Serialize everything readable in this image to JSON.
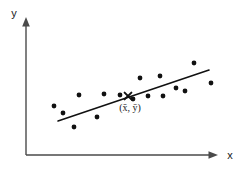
{
  "chart_data": {
    "type": "scatter",
    "title": "",
    "xlabel": "x",
    "ylabel": "y",
    "grid": false,
    "legend": false,
    "axis_style": "arrow-axes-unscaled",
    "xlim": [
      0,
      100
    ],
    "ylim": [
      0,
      100
    ],
    "points": [
      {
        "px": 54,
        "py": 106
      },
      {
        "px": 79,
        "py": 95
      },
      {
        "px": 74,
        "py": 127
      },
      {
        "px": 97,
        "py": 117
      },
      {
        "px": 104,
        "py": 94
      },
      {
        "px": 120,
        "py": 95
      },
      {
        "px": 140,
        "py": 78
      },
      {
        "px": 148,
        "py": 96
      },
      {
        "px": 160,
        "py": 76
      },
      {
        "px": 163,
        "py": 96
      },
      {
        "px": 176,
        "py": 88
      },
      {
        "px": 185,
        "py": 91
      },
      {
        "px": 194,
        "py": 63
      },
      {
        "px": 211,
        "py": 83
      },
      {
        "px": 133,
        "py": 99
      },
      {
        "px": 63,
        "py": 113
      }
    ],
    "trend_line": {
      "x1": 58,
      "y1": 121,
      "x2": 209,
      "y2": 70,
      "description": "least-squares regression line"
    },
    "centroid": {
      "px": 128,
      "py": 96,
      "marker": "x",
      "label": "(x̄, ȳ)",
      "label_px": 130,
      "label_py": 111
    },
    "axes": {
      "origin_x": 26,
      "origin_y": 155,
      "y_axis_top": 20,
      "x_axis_right": 218
    }
  },
  "labels": {
    "y_axis": "y",
    "x_axis": "x",
    "centroid": "(x̄, ȳ)"
  }
}
